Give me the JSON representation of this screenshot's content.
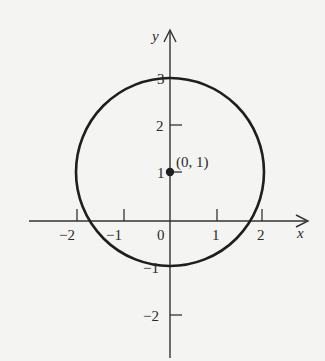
{
  "diagram": {
    "type": "circle-graph",
    "equation_center": [
      0,
      1
    ],
    "radius": 2,
    "axes": {
      "x_label": "x",
      "y_label": "y",
      "x_ticks": [
        {
          "value": -2,
          "label": "−2"
        },
        {
          "value": -1,
          "label": "−1"
        },
        {
          "value": 0,
          "label": "0"
        },
        {
          "value": 1,
          "label": "1"
        },
        {
          "value": 2,
          "label": "2"
        }
      ],
      "y_ticks": [
        {
          "value": 3,
          "label": "3"
        },
        {
          "value": 2,
          "label": "2"
        },
        {
          "value": 1,
          "label": "1"
        },
        {
          "value": -1,
          "label": "−1"
        },
        {
          "value": -2,
          "label": "−2"
        }
      ]
    },
    "center_point": {
      "label": "(0, 1)"
    },
    "colors": {
      "stroke": "#1e1e1e",
      "background": "#f4f4f2"
    }
  }
}
